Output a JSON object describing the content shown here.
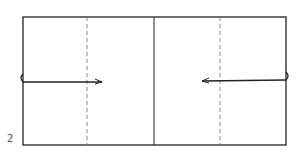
{
  "diagram": {
    "type": "origami-fold-step",
    "step_number": "2",
    "paper": {
      "x": 23,
      "y": 17,
      "width": 263,
      "height": 128
    },
    "center_crease": {
      "x": 154,
      "style": "solid"
    },
    "valley_folds": [
      {
        "x": 87,
        "style": "dashed"
      },
      {
        "x": 220,
        "style": "dashed"
      }
    ],
    "arrows": [
      {
        "from_x": 23,
        "to_x": 102,
        "y": 82,
        "direction": "right"
      },
      {
        "from_x": 286,
        "to_x": 202,
        "y": 81,
        "direction": "left"
      }
    ],
    "colors": {
      "line": "#222222",
      "dash": "#888888"
    }
  }
}
